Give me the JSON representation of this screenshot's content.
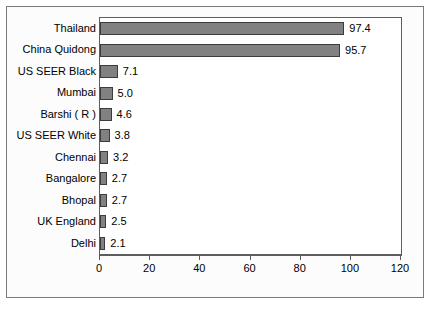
{
  "chart_data": {
    "type": "bar",
    "orientation": "horizontal",
    "title": "",
    "xlabel": "",
    "ylabel": "",
    "xlim": [
      0,
      120
    ],
    "xticks": [
      0,
      20,
      40,
      60,
      80,
      100,
      120
    ],
    "grid": false,
    "legend": null,
    "categories": [
      "Thailand",
      "China Quidong",
      "US SEER Black",
      "Mumbai",
      "Barshi ( R )",
      "US SEER White",
      "Chennai",
      "Bangalore",
      "Bhopal",
      "UK England",
      "Delhi"
    ],
    "values": [
      97.4,
      95.7,
      7.1,
      5.0,
      4.6,
      3.8,
      3.2,
      2.7,
      2.7,
      2.5,
      2.1
    ],
    "value_labels": [
      "97.4",
      "95.7",
      "7.1",
      "5.0",
      "4.6",
      "3.8",
      "3.2",
      "2.7",
      "2.7",
      "2.5",
      "2.1"
    ],
    "colors": {
      "bar_fill": "#818181",
      "bar_border": "#3c3c3c",
      "plot_background": "#ffffff",
      "figure_background": "#fcfcfc",
      "axis": "#5d5d5d",
      "text": "#000000"
    }
  }
}
